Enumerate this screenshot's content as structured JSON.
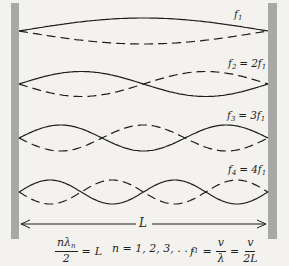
{
  "figure": {
    "background_color": "#f4f2ee",
    "wall_color": "#a8a8a8",
    "line_color": "#1f1f1f"
  },
  "harmonics": [
    {
      "n": 1,
      "f": "f",
      "fsub": "1",
      "eq": "",
      "coef": "",
      "f2": "",
      "f2sub": ""
    },
    {
      "n": 2,
      "f": "f",
      "fsub": "2",
      "eq": "=",
      "coef": "2",
      "f2": "f",
      "f2sub": "1"
    },
    {
      "n": 3,
      "f": "f",
      "fsub": "3",
      "eq": "=",
      "coef": "3",
      "f2": "f",
      "f2sub": "1"
    },
    {
      "n": 4,
      "f": "f",
      "fsub": "4",
      "eq": "=",
      "coef": "4",
      "f2": "f",
      "f2sub": "1"
    }
  ],
  "length_marker": {
    "label": "L"
  },
  "formulas": {
    "relation": {
      "num_main": "nλ",
      "num_sub": "n",
      "den": "2",
      "rhs_eq": "=",
      "rhs": "L"
    },
    "n_values": "n = 1, 2, 3, . . .",
    "frequency": {
      "lhs_main": "f",
      "lhs_sub": "1",
      "eq1": "=",
      "num1": "v",
      "den1": "λ",
      "eq2": "=",
      "num2": "v",
      "den2": "2L"
    }
  },
  "chart_data": {
    "type": "line",
    "x_range": [
      0,
      1
    ],
    "x_span_label": "L",
    "series": [
      {
        "name": "fundamental",
        "n": 1,
        "frequency_label": "f1",
        "relation": "f1",
        "antinodes": 1,
        "styles": [
          "solid +sin(πx/L)",
          "dashed −sin(πx/L)"
        ]
      },
      {
        "name": "second harmonic",
        "n": 2,
        "frequency_label": "f2",
        "relation": "2f1",
        "antinodes": 2,
        "styles": [
          "solid +sin(2πx/L)",
          "dashed −sin(2πx/L)"
        ]
      },
      {
        "name": "third harmonic",
        "n": 3,
        "frequency_label": "f3",
        "relation": "3f1",
        "antinodes": 3,
        "styles": [
          "solid +sin(3πx/L)",
          "dashed −sin(3πx/L)"
        ]
      },
      {
        "name": "fourth harmonic",
        "n": 4,
        "frequency_label": "f4",
        "relation": "4f1",
        "antinodes": 4,
        "styles": [
          "solid +sin(4πx/L)",
          "dashed −sin(4πx/L)"
        ]
      }
    ],
    "equations": [
      "nλn/2 = L,  n = 1, 2, 3, …",
      "f1 = v/λ = v/2L"
    ]
  }
}
